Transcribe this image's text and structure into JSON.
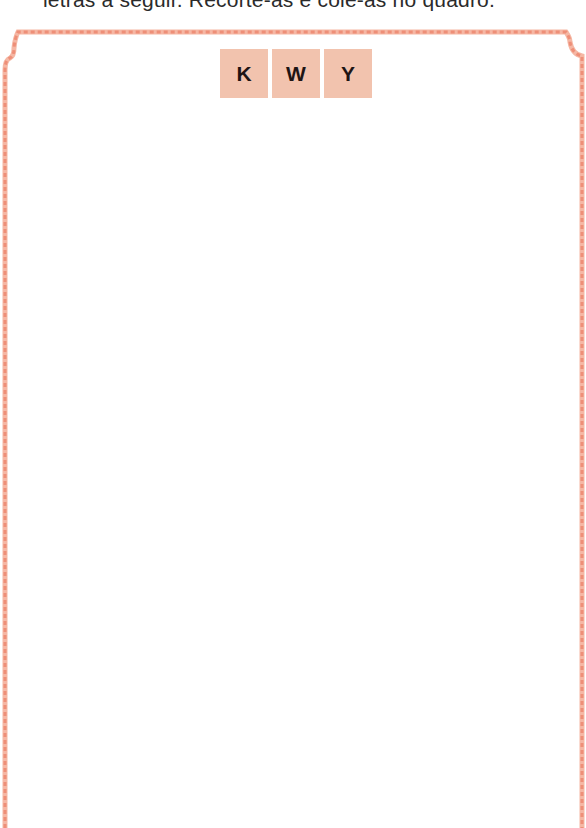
{
  "instruction": {
    "text": "letras a seguir. Recorte-as e cole-as no quadro."
  },
  "frame": {
    "border_color": "#ee8f78",
    "style": "dashed"
  },
  "tiles": [
    {
      "letter": "K"
    },
    {
      "letter": "W"
    },
    {
      "letter": "Y"
    }
  ],
  "colors": {
    "tile_background": "#f2c3ae",
    "tile_text": "#1e1414",
    "border": "#ee8f78"
  }
}
